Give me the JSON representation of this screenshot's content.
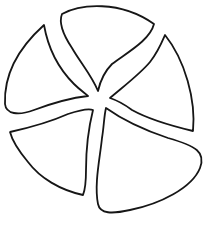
{
  "figure": {
    "petal_count": 5,
    "colors": {
      "background": "#ffffff",
      "stroke": "#161616",
      "fill": "#ffffff"
    },
    "petals": [
      {
        "name": "top",
        "path": "M62,14 C80,4 120,0 154,24 C150,40 128,52 112,64 C104,72 100,82 98,91 C92,76 80,62 72,48 C64,36 58,24 62,14 Z"
      },
      {
        "name": "right",
        "path": "M165,35 C185,60 196,100 193,131 C172,126 150,120 132,110 C124,104 116,100 110,98 C124,86 140,74 150,62 C158,52 162,42 165,35 Z"
      },
      {
        "name": "bottom-right",
        "path": "M106,108 C120,118 138,128 168,138 C196,146 206,152 200,168 C192,188 160,204 130,210 C112,214 100,214 98,204 C94,184 100,158 102,138 C104,126 104,116 106,108 Z"
      },
      {
        "name": "bottom-left",
        "path": "M10,132 C28,128 50,122 68,114 C80,110 88,108 93,110 C88,130 86,150 86,170 C86,182 85,190 83,195 C60,190 40,178 28,162 C18,150 12,140 10,132 Z"
      },
      {
        "name": "left",
        "path": "M44,25 C48,48 58,68 74,84 C80,90 86,94 88,96 C70,98 50,104 34,110 C18,116 6,114 5,104 C4,80 14,52 44,25 Z"
      }
    ]
  }
}
